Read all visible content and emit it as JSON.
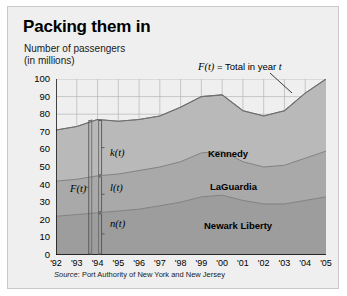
{
  "figure": {
    "title": "Packing them in",
    "subtitle_line1": "Number of passengers",
    "subtitle_line2": "(in millions)",
    "annotation_total": "F(t) = Total in year t",
    "annotation_total_fn": "F(t)",
    "annotation_total_rest": " = Total in year ",
    "annotation_total_var": "t",
    "source": "Source: Port Authority of New York and New Jersey",
    "source_prefix": "Source",
    "source_rest": ": Port Authority of New York and New Jersey"
  },
  "colors": {
    "page_background": "#ffffff",
    "panel_background": "#efefef",
    "panel_border": "#c9c9c9",
    "axis": "#000000",
    "grid": "#b4b4b4",
    "band_kennedy": "#b9b9b9",
    "band_laguardia": "#a9a9a9",
    "band_newark": "#9d9d9d",
    "curve_line": "#808080",
    "text": "#000000"
  },
  "chart_data": {
    "type": "area",
    "title": "Packing them in",
    "subtitle": "Number of passengers (in millions)",
    "xlabel": "",
    "ylabel": "Number of passengers (in millions)",
    "stacked": true,
    "grid": true,
    "legend_position": "inline-labels",
    "xlim": [
      1992,
      2005
    ],
    "ylim": [
      0,
      100
    ],
    "ytick_values": [
      0,
      10,
      20,
      30,
      40,
      50,
      60,
      70,
      80,
      90,
      100
    ],
    "ytick_labels": [
      "0",
      "10",
      "20",
      "30",
      "40",
      "50",
      "60",
      "70",
      "80",
      "90",
      "100"
    ],
    "xtick_values": [
      1992,
      1993,
      1994,
      1995,
      1996,
      1997,
      1998,
      1999,
      2000,
      2001,
      2002,
      2003,
      2004,
      2005
    ],
    "xtick_labels": [
      "'92",
      "'93",
      "'94",
      "'95",
      "'96",
      "'97",
      "'98",
      "'99",
      "'00",
      "'01",
      "'02",
      "'03",
      "'04",
      "'05"
    ],
    "x": [
      1992,
      1993,
      1994,
      1995,
      1996,
      1997,
      1998,
      1999,
      2000,
      2001,
      2002,
      2003,
      2004,
      2005
    ],
    "series": [
      {
        "name": "Newark Liberty",
        "symbol": "n(t)",
        "values": [
          22,
          23,
          24,
          25,
          26,
          28,
          30,
          33,
          34,
          31,
          29,
          29,
          31,
          33
        ]
      },
      {
        "name": "LaGuardia",
        "symbol": "l(t)",
        "values": [
          20,
          20,
          21,
          21,
          22,
          22,
          23,
          25,
          25,
          22,
          21,
          22,
          24,
          26
        ]
      },
      {
        "name": "Kennedy",
        "symbol": "k(t)",
        "values": [
          29,
          30,
          32,
          30,
          29,
          29,
          31,
          32,
          32,
          29,
          29,
          31,
          37,
          41
        ]
      }
    ],
    "total_series": {
      "name": "Total",
      "symbol": "F(t)",
      "values": [
        71,
        73,
        77,
        76,
        77,
        79,
        84,
        90,
        91,
        82,
        79,
        82,
        92,
        100
      ]
    },
    "band_labels": [
      {
        "label": "Kennedy",
        "x_px": 200,
        "y_px": 141
      },
      {
        "label": "LaGuardia",
        "x_px": 202,
        "y_px": 174
      },
      {
        "label": "Newark Liberty",
        "x_px": 196,
        "y_px": 213
      }
    ],
    "function_annotations": [
      {
        "label": "k(t)",
        "x_px": 102,
        "y_px": 140
      },
      {
        "label": "l(t)",
        "x_px": 102,
        "y_px": 175
      },
      {
        "label": "n(t)",
        "x_px": 102,
        "y_px": 211
      },
      {
        "label": "F(t)",
        "x_px": 62,
        "y_px": 176
      }
    ]
  }
}
